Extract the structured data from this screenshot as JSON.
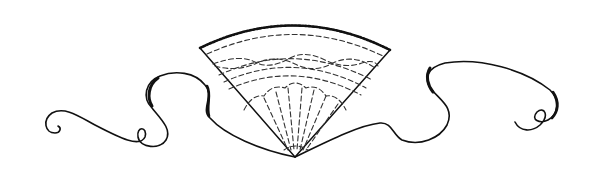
{
  "illustration": {
    "subject": "Folding fan with flowing ribbon scrolls",
    "colors": {
      "background": "#ffffff",
      "ink": "#111111"
    }
  }
}
